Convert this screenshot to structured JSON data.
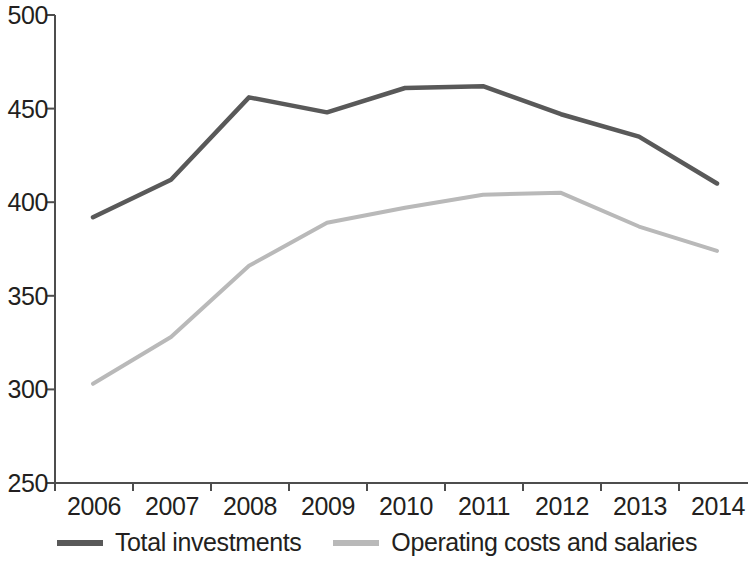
{
  "chart_data": {
    "type": "line",
    "title": "",
    "subtitle": "",
    "xlabel": "",
    "ylabel": "",
    "categories": [
      "2006",
      "2007",
      "2008",
      "2009",
      "2010",
      "2011",
      "2012",
      "2013",
      "2014"
    ],
    "series": [
      {
        "name": "Total investments",
        "color": "#595959",
        "values": [
          392,
          412,
          456,
          448,
          461,
          462,
          447,
          435,
          410
        ]
      },
      {
        "name": "Operating costs and salaries",
        "color": "#b9b9b9",
        "values": [
          303,
          328,
          366,
          389,
          397,
          404,
          405,
          387,
          374
        ]
      }
    ],
    "ylim": [
      250,
      500
    ],
    "yticks": [
      250,
      300,
      350,
      400,
      450,
      500
    ],
    "ytick_labels": [
      "250",
      "300",
      "350",
      "400",
      "450",
      "500"
    ],
    "grid": false,
    "legend_position": "bottom",
    "axis_color": "#4d4d4d"
  },
  "legend": {
    "items": [
      {
        "label": "Total investments",
        "color": "#595959"
      },
      {
        "label": "Operating costs and salaries",
        "color": "#b9b9b9"
      }
    ]
  }
}
